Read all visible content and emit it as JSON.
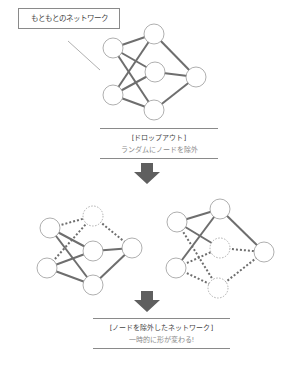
{
  "original": {
    "label": "もともとのネットワーク"
  },
  "dropout_step": {
    "title": "[ドロップアウト]",
    "description": "ランダムにノードを除外"
  },
  "result_step": {
    "title": "[ノードを除外したネットワーク]",
    "description": "一時的に形が変わる!"
  },
  "colors": {
    "edge": "#6e6e6e",
    "node_border": "#9a9a9a",
    "arrow": "#5f5f5f",
    "box_border": "#8a8a8a"
  }
}
